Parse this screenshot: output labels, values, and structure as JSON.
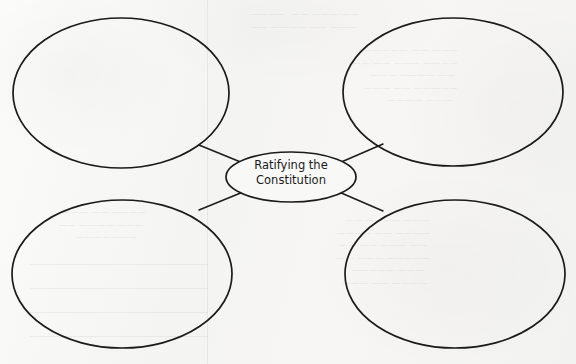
{
  "page": {
    "kind": "worksheet-graphic-organizer",
    "background_color": "#f6f6f4",
    "ink_color": "#1b1b1b",
    "width": 576,
    "height": 364
  },
  "organizer": {
    "center": {
      "name": "center-oval",
      "line1": "Ratifying the",
      "line2": "Constitution",
      "cx": 291,
      "cy": 177,
      "rx": 65,
      "ry": 25
    },
    "nodes": [
      {
        "name": "oval-top-left",
        "label": "",
        "cx": 121,
        "cy": 93,
        "rx": 108,
        "ry": 75
      },
      {
        "name": "oval-top-right",
        "label": "",
        "cx": 453,
        "cy": 92,
        "rx": 110,
        "ry": 74
      },
      {
        "name": "oval-bottom-left",
        "label": "",
        "cx": 122,
        "cy": 274,
        "rx": 110,
        "ry": 74
      },
      {
        "name": "oval-bottom-right",
        "label": "",
        "cx": 455,
        "cy": 274,
        "rx": 110,
        "ry": 74
      }
    ],
    "connectors": [
      {
        "name": "connector-top-left",
        "x1": 199,
        "y1": 145,
        "x2": 243,
        "y2": 163
      },
      {
        "name": "connector-top-right",
        "x1": 383,
        "y1": 144,
        "x2": 339,
        "y2": 163
      },
      {
        "name": "connector-bottom-left",
        "x1": 199,
        "y1": 210,
        "x2": 243,
        "y2": 192
      },
      {
        "name": "connector-bottom-right",
        "x1": 383,
        "y1": 211,
        "x2": 339,
        "y2": 192
      }
    ]
  },
  "bleedthrough": {
    "note": "faint mirrored show-through text from the reverse side of the page; not legible",
    "top_edge": "· ·  ·   ·  ·    · ·",
    "top_right": "—— ——— ——  ————\n ——— —— ———— ——",
    "right": "——— —— —————\n———— ——— —— ——\n —— ———— ———\n————— —— ———\n  ——— ————",
    "bottom_left": "———— —— ———\n ——— ———— ——\n   ———————",
    "bottom_right": "——— ———— ——\n———— —— ————\n —— ——— —— ——\n————— ——— ——\n  ——— —————\n ———— —— ———"
  }
}
